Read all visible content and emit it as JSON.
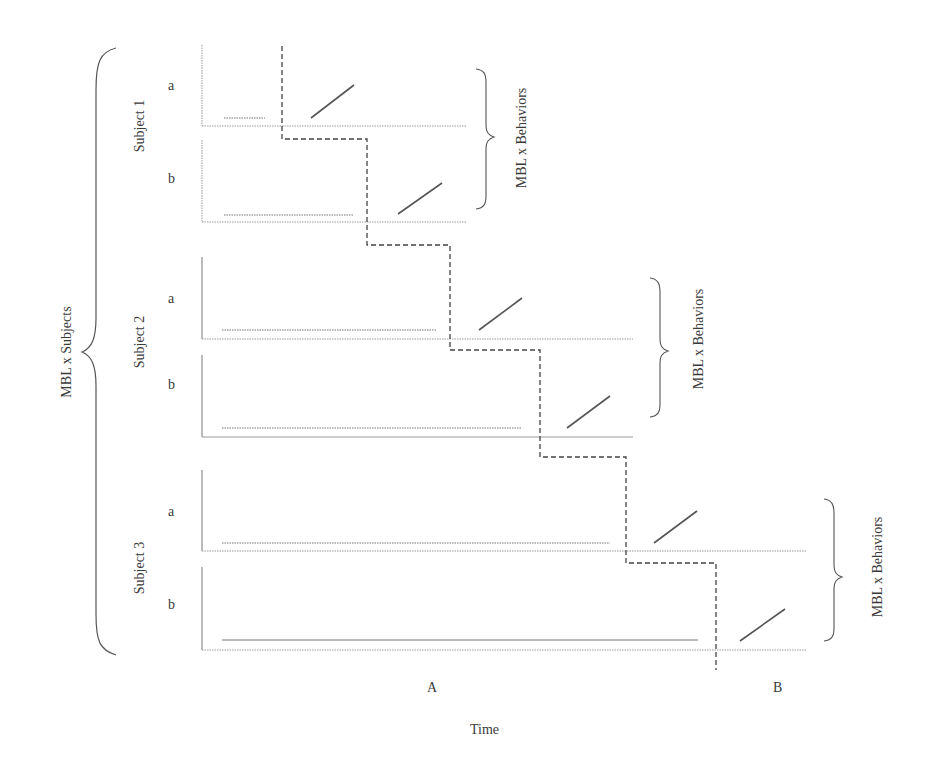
{
  "diagram": {
    "type": "multiple-baseline-design",
    "outer_brace_label": "MBL x Subjects",
    "subjects": [
      {
        "label": "Subject 1",
        "brace_label": "MBL x Behaviors",
        "behaviors": [
          {
            "label": "a",
            "baseline_end_x": 265,
            "intervention_start_x": 311,
            "intervention_end_x": 354
          },
          {
            "label": "b",
            "baseline_end_x": 354,
            "intervention_start_x": 398,
            "intervention_end_x": 442
          }
        ]
      },
      {
        "label": "Subject 2",
        "brace_label": "MBL x Behaviors",
        "behaviors": [
          {
            "label": "a",
            "baseline_end_x": 437,
            "intervention_start_x": 479,
            "intervention_end_x": 522
          },
          {
            "label": "b",
            "baseline_end_x": 522,
            "intervention_start_x": 567,
            "intervention_end_x": 610
          }
        ]
      },
      {
        "label": "Subject 3",
        "brace_label": "MBL x Behaviors",
        "behaviors": [
          {
            "label": "a",
            "baseline_end_x": 610,
            "intervention_start_x": 654,
            "intervention_end_x": 697
          },
          {
            "label": "b",
            "baseline_end_x": 698,
            "intervention_start_x": 740,
            "intervention_end_x": 785
          }
        ]
      }
    ],
    "phase_labels": {
      "baseline": "A",
      "intervention": "B"
    },
    "x_axis_label": "Time",
    "colors": {
      "line": "#555555",
      "axis": "#8a8a8a",
      "text": "#3a3a3a",
      "background": "#ffffff"
    }
  }
}
